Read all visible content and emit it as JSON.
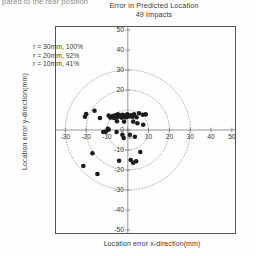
{
  "page": {
    "cut_off_header": "pared to the rear position",
    "title_line_1": "Error in Predicted Location",
    "title_line_2": "49 Impacts"
  },
  "legend": {
    "lines": [
      "r = 30mm, 100%",
      "r = 20mm, 92%",
      "r = 10mm, 41%"
    ]
  },
  "axis_titles": {
    "x": "Location error x-direction(mm)",
    "y": "Location error y-direction(mm)"
  },
  "colors": {
    "frame": "#545454",
    "axis": "#6a6a6a",
    "circle": "#8a8a8a",
    "marker": "#1c1c1c",
    "text": "#3a3a3a"
  },
  "chart_data": {
    "type": "scatter",
    "title": "Error in Predicted Location",
    "subtitle": "49 Impacts",
    "xlabel": "Location error x-direction(mm)",
    "ylabel": "Location error y-direction(mm)",
    "xlim": [
      -35,
      52
    ],
    "ylim": [
      -52,
      52
    ],
    "xticks": [
      -30,
      -20,
      -10,
      0,
      10,
      20,
      30,
      40,
      50
    ],
    "yticks": [
      50,
      40,
      30,
      20,
      0,
      -10,
      -20,
      -30,
      -40,
      -50
    ],
    "xtick_labels": [
      "-30",
      "-20",
      "-10",
      "0",
      "10",
      "20",
      "30",
      "40",
      "50"
    ],
    "ytick_labels": [
      "50",
      "40",
      "30",
      "20",
      "0",
      "-10",
      "-20",
      "-30",
      "-40",
      "-50"
    ],
    "grid": false,
    "legend_position": "upper-left-inside",
    "annotations": [
      {
        "text": "r = 30mm, 100%",
        "radius_mm": 30,
        "percent": 100
      },
      {
        "text": "r = 20mm, 92%",
        "radius_mm": 20,
        "percent": 92
      },
      {
        "text": "r = 10mm, 41%",
        "radius_mm": 10,
        "percent": 41
      }
    ],
    "reference_circles": [
      {
        "radius": 10,
        "center": [
          0,
          0
        ],
        "style": "dotted"
      },
      {
        "radius": 20,
        "center": [
          0,
          0
        ],
        "style": "dotted"
      },
      {
        "radius": 30,
        "center": [
          0,
          0
        ],
        "style": "dotted"
      }
    ],
    "n_points": 49,
    "marker": {
      "shape": "circle",
      "size": 2.3,
      "color": "#1c1c1c"
    },
    "points": [
      [
        -20.0,
        8.0
      ],
      [
        -20.6,
        6.6
      ],
      [
        -16.0,
        9.6
      ],
      [
        -13.4,
        6.0
      ],
      [
        -9.2,
        7.2
      ],
      [
        -8.4,
        6.2
      ],
      [
        -7.2,
        7.0
      ],
      [
        -6.6,
        6.0
      ],
      [
        -6.0,
        7.4
      ],
      [
        -5.4,
        6.4
      ],
      [
        -4.8,
        7.8
      ],
      [
        -4.2,
        6.8
      ],
      [
        -3.6,
        7.2
      ],
      [
        -3.0,
        6.2
      ],
      [
        -2.6,
        7.6
      ],
      [
        -2.0,
        6.6
      ],
      [
        -1.4,
        7.2
      ],
      [
        -0.8,
        6.4
      ],
      [
        -0.2,
        7.8
      ],
      [
        0.6,
        6.8
      ],
      [
        1.4,
        7.4
      ],
      [
        2.2,
        6.6
      ],
      [
        3.0,
        7.8
      ],
      [
        4.2,
        6.4
      ],
      [
        5.4,
        8.4
      ],
      [
        7.2,
        7.6
      ],
      [
        8.6,
        7.8
      ],
      [
        -5.2,
        4.4
      ],
      [
        -1.8,
        4.2
      ],
      [
        2.6,
        4.2
      ],
      [
        4.6,
        3.4
      ],
      [
        7.4,
        2.6
      ],
      [
        -9.6,
        0.6
      ],
      [
        -9.2,
        0.2
      ],
      [
        -10.6,
        -0.8
      ],
      [
        -11.8,
        -1.0
      ],
      [
        -5.4,
        -1.0
      ],
      [
        -2.6,
        -2.4
      ],
      [
        -2.0,
        -4.0
      ],
      [
        1.0,
        -2.4
      ],
      [
        3.4,
        -3.4
      ],
      [
        -17.0,
        -11.6
      ],
      [
        6.0,
        -11.0
      ],
      [
        -4.2,
        -15.4
      ],
      [
        1.4,
        -15.0
      ],
      [
        2.6,
        -16.4
      ],
      [
        4.0,
        -15.6
      ],
      [
        -21.4,
        -18.0
      ],
      [
        -14.6,
        -22.0
      ]
    ]
  }
}
